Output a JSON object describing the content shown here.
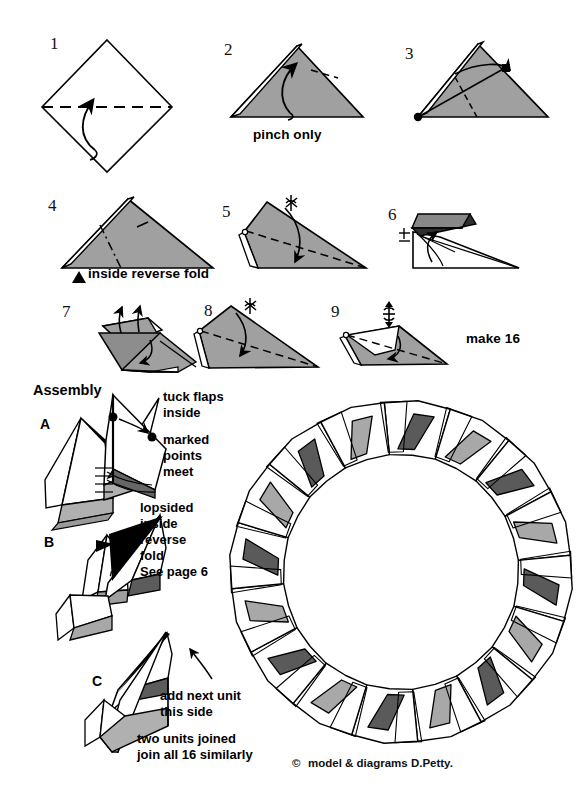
{
  "page": {
    "background": "#ffffff",
    "width": 583,
    "height": 812
  },
  "colors": {
    "ink": "#000000",
    "paper_white": "#ffffff",
    "shaded_gray": "#a0a0a0",
    "light_gray": "#b0b0b0",
    "dark_gray": "#5a5a5a",
    "mid_gray": "#888888"
  },
  "steps": [
    {
      "id": "1",
      "number": "1",
      "caption": ""
    },
    {
      "id": "2",
      "number": "2",
      "caption": "pinch only"
    },
    {
      "id": "3",
      "number": "3",
      "caption": ""
    },
    {
      "id": "4",
      "number": "4",
      "caption": "inside reverse fold"
    },
    {
      "id": "5",
      "number": "5",
      "caption": ""
    },
    {
      "id": "6",
      "number": "6",
      "caption": ""
    },
    {
      "id": "7",
      "number": "7",
      "caption": ""
    },
    {
      "id": "8",
      "number": "8",
      "caption": ""
    },
    {
      "id": "9",
      "number": "9",
      "caption": ""
    }
  ],
  "notes": {
    "make_count": "make 16",
    "assembly_heading": "Assembly",
    "tuck_flaps": "tuck flaps\ninside",
    "marked_points": "marked\npoints\nmeet",
    "lopsided": "lopsided\ninside\nreverse\nfold\nSee page 6",
    "add_next_unit": "add next unit\nthis side",
    "two_units": "two units joined\njoin all 16 similarly"
  },
  "assembly_steps": [
    {
      "id": "A",
      "label": "A"
    },
    {
      "id": "B",
      "label": "B"
    },
    {
      "id": "C",
      "label": "C"
    }
  ],
  "ring": {
    "unit_count": 16,
    "center_x": 401,
    "center_y": 572,
    "outer_radius": 170,
    "inner_radius": 118,
    "panel_colors": [
      "#5a5a5a",
      "#a8a8a8"
    ]
  },
  "credit": {
    "symbol": "©",
    "text": "model & diagrams D.Petty."
  }
}
